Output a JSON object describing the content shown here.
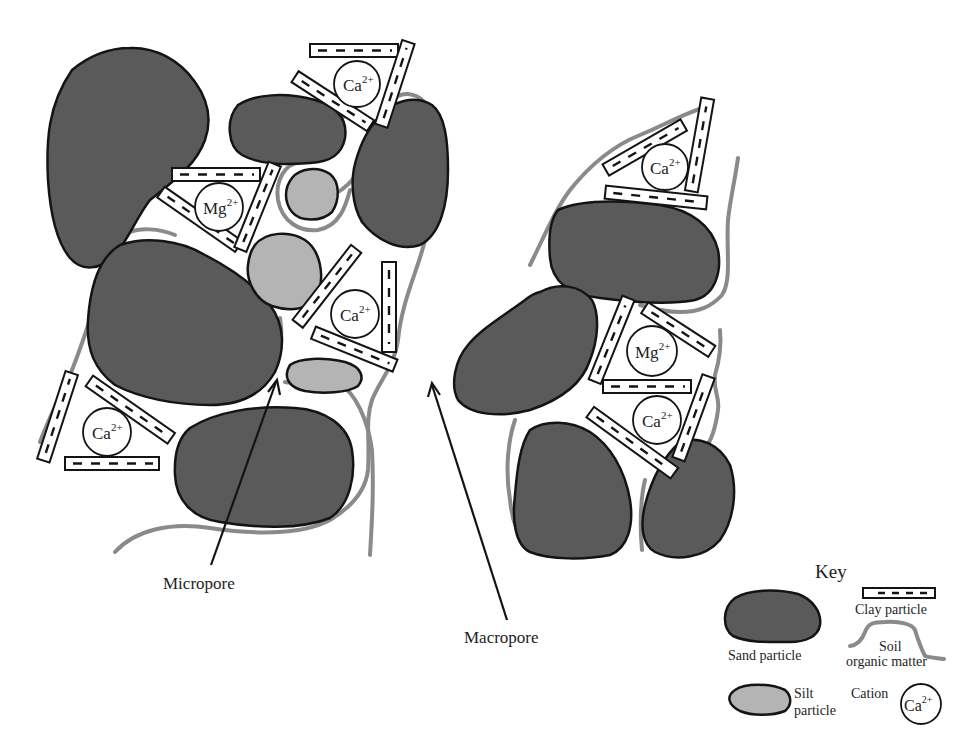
{
  "figure": {
    "labels": {
      "micropore": "Micropore",
      "macropore": "Macropore"
    },
    "cations": [
      {
        "id": "ca-top",
        "element": "Ca",
        "charge": "2+"
      },
      {
        "id": "mg-left",
        "element": "Mg",
        "charge": "2+"
      },
      {
        "id": "ca-center",
        "element": "Ca",
        "charge": "2+"
      },
      {
        "id": "ca-lower-left",
        "element": "Ca",
        "charge": "2+"
      },
      {
        "id": "ca-right-top",
        "element": "Ca",
        "charge": "2+"
      },
      {
        "id": "mg-right",
        "element": "Mg",
        "charge": "2+"
      },
      {
        "id": "ca-right-bottom",
        "element": "Ca",
        "charge": "2+"
      }
    ]
  },
  "key": {
    "title": "Key",
    "items": [
      {
        "id": "sand",
        "label": "Sand particle"
      },
      {
        "id": "clay",
        "label": "Clay particle"
      },
      {
        "id": "som",
        "label_line1": "Soil",
        "label_line2": "organic matter"
      },
      {
        "id": "silt",
        "label_line1": "Silt",
        "label_line2": "particle"
      },
      {
        "id": "cation",
        "label": "Cation",
        "example_element": "Ca",
        "example_charge": "2+"
      }
    ]
  },
  "colors": {
    "sand": "#5a5a5a",
    "silt": "#b4b4b4",
    "organic_matter": "#8a8a8a",
    "outline": "#141414",
    "background": "#ffffff"
  }
}
